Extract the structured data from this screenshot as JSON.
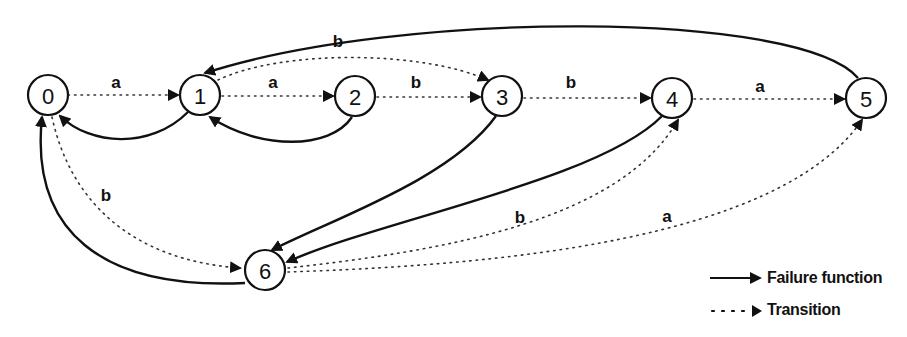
{
  "diagram": {
    "type": "finite automaton (string matching with failure function)",
    "nodes": [
      {
        "id": "0",
        "label": "0",
        "x": 48,
        "y": 95
      },
      {
        "id": "1",
        "label": "1",
        "x": 200,
        "y": 95
      },
      {
        "id": "2",
        "label": "2",
        "x": 355,
        "y": 96
      },
      {
        "id": "3",
        "label": "3",
        "x": 502,
        "y": 96
      },
      {
        "id": "4",
        "label": "4",
        "x": 672,
        "y": 98
      },
      {
        "id": "5",
        "label": "5",
        "x": 866,
        "y": 98
      },
      {
        "id": "6",
        "label": "6",
        "x": 265,
        "y": 270
      }
    ],
    "transitions": [
      {
        "from": "0",
        "to": "1",
        "label": "a"
      },
      {
        "from": "1",
        "to": "2",
        "label": "a"
      },
      {
        "from": "1",
        "to": "3",
        "label": "b"
      },
      {
        "from": "2",
        "to": "3",
        "label": "b"
      },
      {
        "from": "3",
        "to": "4",
        "label": "b"
      },
      {
        "from": "4",
        "to": "5",
        "label": "a"
      },
      {
        "from": "0",
        "to": "6",
        "label": "b"
      },
      {
        "from": "6",
        "to": "4",
        "label": "b"
      },
      {
        "from": "6",
        "to": "5",
        "label": "a"
      }
    ],
    "failure_edges": [
      {
        "from": "1",
        "to": "0"
      },
      {
        "from": "2",
        "to": "1"
      },
      {
        "from": "3",
        "to": "6"
      },
      {
        "from": "4",
        "to": "6"
      },
      {
        "from": "5",
        "to": "1"
      },
      {
        "from": "6",
        "to": "0"
      }
    ],
    "edge_labels": {
      "t01": "a",
      "t12": "a",
      "t13": "b",
      "t23": "b",
      "t34": "b",
      "t45": "a",
      "t06": "b",
      "t64": "b",
      "t65": "a"
    }
  },
  "legend": {
    "failure_label": "Failure function",
    "transition_label": "Transition"
  },
  "colors": {
    "ink": "#111111",
    "background": "#ffffff"
  }
}
